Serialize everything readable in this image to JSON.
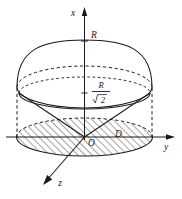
{
  "figure": {
    "type": "geometry-diagram",
    "axes": [
      {
        "id": "vertical",
        "label": "x",
        "direction": "up"
      },
      {
        "id": "horizontal",
        "label": "y",
        "direction": "right"
      },
      {
        "id": "oblique",
        "label": "z",
        "direction": "down-left"
      }
    ],
    "labels": {
      "axis_vertical": "x",
      "axis_horizontal": "y",
      "axis_oblique": "z",
      "sphere_top": "R",
      "fraction_numerator": "R",
      "fraction_denominator": "2",
      "radical_symbol": "√",
      "origin": "O",
      "region": "D"
    },
    "colors": {
      "ink": "#1a1a1a",
      "background": "#ffffff",
      "hatch": "#1a1a1a"
    },
    "elements": [
      "sphere-top-cap-outline",
      "sphere-equator-ellipse",
      "cone-surface",
      "cone-base-ellipse",
      "projection-region-D-hatched",
      "dashed-projection-lines",
      "axis-ticks"
    ]
  }
}
